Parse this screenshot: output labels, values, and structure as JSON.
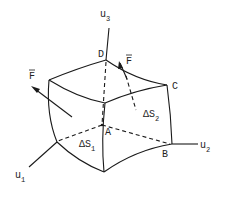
{
  "diagram": {
    "labels": {
      "u1": "u",
      "u1_sub": "1",
      "u2": "u",
      "u2_sub": "2",
      "u3": "u",
      "u3_sub": "3",
      "A": "A",
      "B": "B",
      "C": "C",
      "D": "D",
      "F_left": "F",
      "F_right": "F",
      "dS1": "ΔS",
      "dS1_sub": "1",
      "dS2": "ΔS",
      "dS2_sub": "2"
    },
    "colors": {
      "stroke": "#1a1a1a",
      "background": "#ffffff"
    }
  }
}
